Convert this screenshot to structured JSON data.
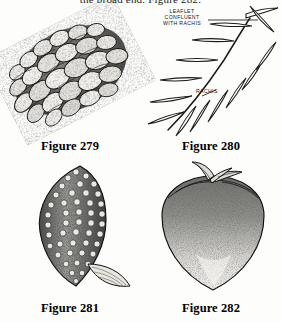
{
  "page": {
    "background_color": "#fdfdfc",
    "ink_color": "#111111",
    "running_text": "the broad end.  Figure 282."
  },
  "figures": [
    {
      "id": "fig279",
      "caption": "Figure 279",
      "subject": "pine-cone",
      "description": "Engraved pine cone with overlapping woody scales, oriented diagonally"
    },
    {
      "id": "fig280",
      "caption": "Figure 280",
      "subject": "pinnate-leaf-diagram",
      "description": "Line diagram of a pinnate leaf showing rachis and confluent leaflets",
      "annotations": [
        {
          "id": "leaflet",
          "text": "LEAFLET\nCONFLUENT\nWITH RACHIS",
          "lines": [
            "LEAFLET",
            "CONFLUENT",
            "WITH RACHIS"
          ]
        },
        {
          "id": "rachis",
          "text": "RACHIS",
          "lines": [
            "RACHIS"
          ]
        }
      ]
    },
    {
      "id": "fig281",
      "caption": "Figure 281",
      "subject": "catkin-spike",
      "description": "Elongated tapering catkin/spike with dense bumpy texture and a bract leaf at the base"
    },
    {
      "id": "fig282",
      "caption": "Figure 282",
      "subject": "fruit",
      "description": "Stippled conical fruit, broad at the top, with a short curved stem and calyx"
    }
  ]
}
